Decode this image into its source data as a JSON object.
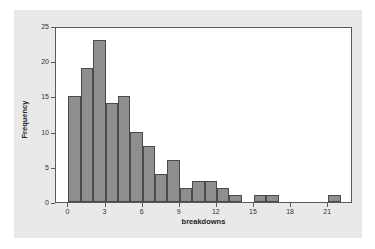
{
  "chart_data": {
    "type": "bar",
    "title": "",
    "subtitle": "",
    "xlabel": "breakdowns",
    "ylabel": "Frequency",
    "grid": false,
    "legend": null,
    "legend_position": "none",
    "xlim": [
      -1,
      23
    ],
    "ylim": [
      0,
      25
    ],
    "xticks": [
      "0",
      "3",
      "6",
      "9",
      "12",
      "15",
      "18",
      "21"
    ],
    "xtick_values": [
      0,
      3,
      6,
      9,
      12,
      15,
      18,
      21
    ],
    "yticks": [
      "0",
      "5",
      "10",
      "15",
      "20",
      "25"
    ],
    "ytick_values": [
      0,
      5,
      10,
      15,
      20,
      25
    ],
    "bin_width": 1,
    "bin_starts": [
      0,
      1,
      2,
      3,
      4,
      5,
      6,
      7,
      8,
      9,
      10,
      11,
      12,
      13,
      15,
      16,
      21
    ],
    "categories": [
      "0-1",
      "1-2",
      "2-3",
      "3-4",
      "4-5",
      "5-6",
      "6-7",
      "7-8",
      "8-9",
      "9-10",
      "10-11",
      "11-12",
      "12-13",
      "13-14",
      "15-16",
      "16-17",
      "21-22"
    ],
    "values": [
      15,
      19,
      23,
      14,
      15,
      10,
      8,
      4,
      6,
      2,
      3,
      3,
      2,
      1,
      1,
      1,
      1
    ],
    "bar_color": "#8e8e8e",
    "bar_edge_color": "#4a4a4a",
    "plot_background": "#ffffff",
    "figure_background": "#e9e9e9"
  }
}
